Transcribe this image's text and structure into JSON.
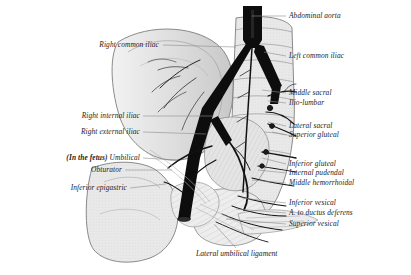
{
  "figure": {
    "style": "engraving",
    "ink": "#1c1c1c",
    "leader_color": "#8d8d8d",
    "background": "#ffffff"
  },
  "labels_right": [
    {
      "text": "Abdominal aorta",
      "name": "label-abdominal-aorta"
    },
    {
      "text": "Left common iliac",
      "name": "label-left-common-iliac"
    },
    {
      "text": "Middle sacral",
      "name": "label-middle-sacral"
    },
    {
      "text": "Ilio-lumbar",
      "name": "label-ilio-lumbar"
    },
    {
      "text": "Lateral sacral",
      "name": "label-lateral-sacral"
    },
    {
      "text": "Superior gluteal",
      "name": "label-superior-gluteal"
    },
    {
      "text": "Inferior gluteal",
      "name": "label-inferior-gluteal"
    },
    {
      "text": "Internal pudendal",
      "name": "label-internal-pudendal"
    },
    {
      "text": "Middle hemorrhoidal",
      "name": "label-middle-hemorrhoidal"
    },
    {
      "text": "Inferior vesical",
      "name": "label-inferior-vesical"
    },
    {
      "text": "A. to ductus deferens",
      "name": "label-a-to-ductus-deferens"
    },
    {
      "text": "Superior vesical",
      "name": "label-superior-vesical"
    }
  ],
  "labels_left": [
    {
      "text": "Right common iliac",
      "name": "label-right-common-iliac"
    },
    {
      "text": "Right internal iliac",
      "name": "label-right-internal-iliac"
    },
    {
      "text": "Right external iliac",
      "name": "label-right-external-iliac"
    },
    {
      "text": "Obturator",
      "name": "label-obturator"
    },
    {
      "text": "Inferior epigastric",
      "name": "label-inferior-epigastric"
    }
  ],
  "label_umbilical": {
    "prefix": "(",
    "qualifier": "In the fetus",
    "suffix": ")",
    "text": "Umbilical",
    "name": "label-umbilical"
  },
  "caption_bottom": {
    "text": "Lateral umbilical ligament",
    "name": "label-lateral-umbilical-ligament"
  }
}
